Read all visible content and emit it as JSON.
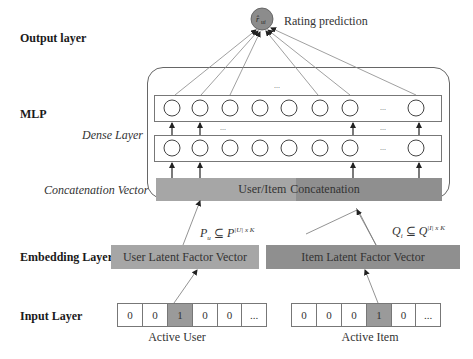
{
  "layers": {
    "output": "Output layer",
    "mlp": "MLP",
    "dense": "Dense Layer",
    "concat": "Concatenation Vector",
    "embedding": "Embedding Layer",
    "input": "Input Layer"
  },
  "output_node": {
    "symbol": "r̂",
    "subscript": "ui",
    "label": "Rating prediction",
    "color": "#8c8c8c"
  },
  "dense_layers": {
    "node_count_visible": 8,
    "ellipsis": "...",
    "between_rows_ellipsis": "..."
  },
  "concatenation": {
    "left_text": "User/Item",
    "right_text": "Concatenation",
    "left_color": "#a6a6a6",
    "right_color": "#8f8f8f"
  },
  "embedding": {
    "user_label": "User Latent Factor Vector",
    "item_label": "Item Latent Factor Vector",
    "user_color": "#a6a6a6",
    "item_color": "#8f8f8f",
    "user_formula": {
      "lhs": "P",
      "lhs_sub": "u",
      "op": "⊆",
      "rhs": "P",
      "rhs_sup": "|U| x K"
    },
    "item_formula": {
      "lhs": "Q",
      "lhs_sub": "i",
      "op": "⊆",
      "rhs": "Q",
      "rhs_sup": "|I| x K"
    }
  },
  "input": {
    "user_cells": [
      "0",
      "0",
      "1",
      "0",
      "0",
      "..."
    ],
    "user_active_index": 2,
    "user_caption": "Active User",
    "item_cells": [
      "0",
      "0",
      "0",
      "1",
      "0",
      "..."
    ],
    "item_active_index": 3,
    "item_caption": "Active Item",
    "active_color": "#9a9a9a"
  }
}
